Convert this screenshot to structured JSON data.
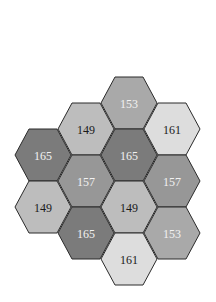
{
  "diagram": {
    "type": "hexagonal-grid",
    "orientation": "flat-top",
    "tiles": [
      {
        "id": "t1",
        "col": 2,
        "row": 0,
        "value": "153",
        "fill": "#a9a9a9",
        "text_color": "#f2f2f2"
      },
      {
        "id": "t2",
        "col": 1,
        "row": 1,
        "value": "149",
        "fill": "#bdbdbd",
        "text_color": "#1a1a1a"
      },
      {
        "id": "t3",
        "col": 3,
        "row": 1,
        "value": "161",
        "fill": "#dddddd",
        "text_color": "#1a1a1a"
      },
      {
        "id": "t4",
        "col": 0,
        "row": 2,
        "value": "165",
        "fill": "#7b7b7b",
        "text_color": "#f2f2f2"
      },
      {
        "id": "t5",
        "col": 2,
        "row": 2,
        "value": "165",
        "fill": "#7b7b7b",
        "text_color": "#f2f2f2"
      },
      {
        "id": "t6",
        "col": 1,
        "row": 3,
        "value": "157",
        "fill": "#979797",
        "text_color": "#f2f2f2"
      },
      {
        "id": "t7",
        "col": 3,
        "row": 3,
        "value": "157",
        "fill": "#979797",
        "text_color": "#f2f2f2"
      },
      {
        "id": "t8",
        "col": 0,
        "row": 4,
        "value": "149",
        "fill": "#bdbdbd",
        "text_color": "#1a1a1a"
      },
      {
        "id": "t9",
        "col": 2,
        "row": 4,
        "value": "149",
        "fill": "#bdbdbd",
        "text_color": "#1a1a1a"
      },
      {
        "id": "t10",
        "col": 1,
        "row": 5,
        "value": "165",
        "fill": "#7b7b7b",
        "text_color": "#f2f2f2"
      },
      {
        "id": "t11",
        "col": 3,
        "row": 5,
        "value": "153",
        "fill": "#a9a9a9",
        "text_color": "#f2f2f2"
      },
      {
        "id": "t12",
        "col": 2,
        "row": 6,
        "value": "161",
        "fill": "#dddddd",
        "text_color": "#1a1a1a"
      }
    ],
    "stroke_color": "#2b2b2b"
  }
}
